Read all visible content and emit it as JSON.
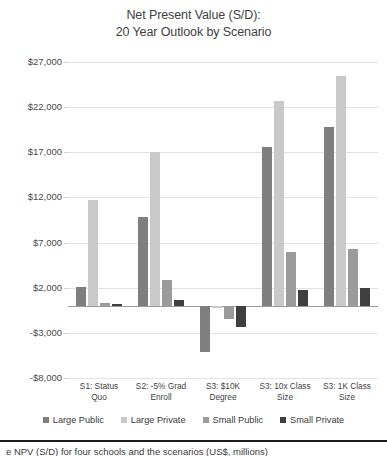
{
  "chart_data": {
    "type": "bar",
    "title": "Net Present Value (S/D): 20 Year Outlook by Scenario",
    "title_lines": [
      "Net Present Value (S/D):",
      "20 Year Outlook by Scenario"
    ],
    "xlabel": "",
    "ylabel": "",
    "ylim": [
      -8000,
      27000
    ],
    "ytick_step": 5000,
    "ytick_labels": [
      "$27,000",
      "$22,000",
      "$17,000",
      "$12,000",
      "$7,000",
      "$2,000",
      "-$3,000",
      "-$8,000"
    ],
    "ytick_values": [
      27000,
      22000,
      17000,
      12000,
      7000,
      2000,
      -3000,
      -8000
    ],
    "grid": true,
    "legend_position": "bottom",
    "categories": [
      "S1: Status Quo",
      "S2: -5% Grad Enroll",
      "S3: $10K Degree",
      "S3: 10x Class Size",
      "S3: 1K Class Size"
    ],
    "category_lines": [
      [
        "S1: Status",
        "Quo"
      ],
      [
        "S2: -5% Grad",
        "Enroll"
      ],
      [
        "S3: $10K",
        "Degree"
      ],
      [
        "S3: 10x Class",
        "Size"
      ],
      [
        "S3: 1K Class",
        "Size"
      ]
    ],
    "series": [
      {
        "name": "Large Public",
        "color": "#7f7f7f",
        "values": [
          2100,
          9800,
          -5100,
          17600,
          19800
        ]
      },
      {
        "name": "Large Private",
        "color": "#c9c9c9",
        "values": [
          11700,
          17000,
          -200,
          22700,
          25400
        ]
      },
      {
        "name": "Small Public",
        "color": "#9b9b9b",
        "values": [
          300,
          2900,
          -1500,
          6000,
          6300
        ]
      },
      {
        "name": "Small Private",
        "color": "#3f3f3f",
        "values": [
          150,
          600,
          -2400,
          1800,
          2000
        ]
      }
    ]
  },
  "footer": {
    "caption": "e NPV (S/D) for four schools and the scenarios (US$, millions)"
  }
}
